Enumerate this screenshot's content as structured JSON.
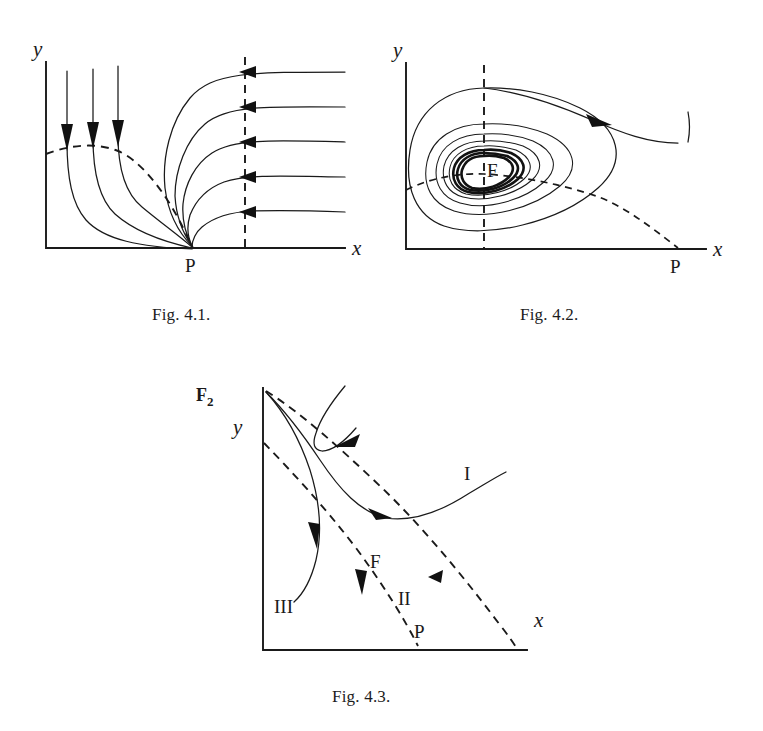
{
  "document": {
    "kind": "mathematics-textbook-figure-plate",
    "background_color": "#ffffff",
    "ink_color": "#1a1a1a"
  },
  "captions": {
    "fig1": "Fig. 4.1.",
    "fig2": "Fig. 4.2.",
    "fig3": "Fig. 4.3."
  },
  "figures": [
    {
      "id": "fig-4-1",
      "caption": "Fig. 4.1.",
      "axes": {
        "x_label": "x",
        "y_label": "y"
      },
      "point_labels": [
        "P"
      ],
      "features": {
        "dashed_nullcline": "descending dashed curve from y-axis to point P on x-axis",
        "dashed_vertical": "vertical dashed line at x of the saddle inflow",
        "trajectories": 5,
        "arrow_count_horizontal": 5,
        "arrow_count_vertical": 3,
        "flow_direction_right": "leftward into the dashed vertical line",
        "flow_direction_top": "downward across the dashed nullcline"
      }
    },
    {
      "id": "fig-4-2",
      "caption": "Fig. 4.2.",
      "axes": {
        "x_label": "x",
        "y_label": "y"
      },
      "point_labels": [
        "F",
        "P"
      ],
      "features": {
        "equilibrium": "F — center surrounded by nested closed orbits",
        "dashed_vertical": "vertical dashed nullcline through F",
        "dashed_horizontal": "horizontal dashed nullcline through F descending to P",
        "closed_orbits": 8,
        "outer_trajectory_arrow": "rightward/downward arrow on outer incoming trajectory"
      }
    },
    {
      "id": "fig-4-3",
      "caption": "Fig. 4.3.",
      "axes": {
        "x_label": "x",
        "y_label": "y"
      },
      "point_labels": [
        "F₂",
        "F",
        "P",
        "I",
        "II",
        "III"
      ],
      "region_labels": [
        "I",
        "II",
        "III"
      ],
      "features": {
        "dashed_nullclines": 2,
        "dashed_nullcline_upper": "from F2 on the y-axis down to the x-axis at the right",
        "dashed_nullcline_lower": "from the y-axis down to the x-axis at P",
        "trajectories": 2,
        "arrow_count": 4
      }
    }
  ],
  "labels": {
    "x": "x",
    "y": "y",
    "P": "P",
    "F": "F",
    "F2_base": "F",
    "F2_sub": "2",
    "region_I": "I",
    "region_II": "II",
    "region_III": "III"
  }
}
